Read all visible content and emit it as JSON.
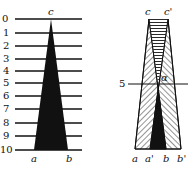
{
  "left_figure": {
    "scale_labels": [
      "0",
      "1",
      "2",
      "3",
      "4",
      "5",
      "6",
      "7",
      "8",
      "9",
      "10"
    ],
    "apex_label": "c",
    "base_labels": [
      "a",
      "b"
    ]
  },
  "right_figure": {
    "apex_labels": [
      "c",
      "c'"
    ],
    "level_label": "5",
    "angle_label": "α",
    "base_labels": [
      "a",
      "a'",
      "b",
      "b'"
    ]
  },
  "colors": {
    "ink": "#111111",
    "background": "#ffffff"
  }
}
